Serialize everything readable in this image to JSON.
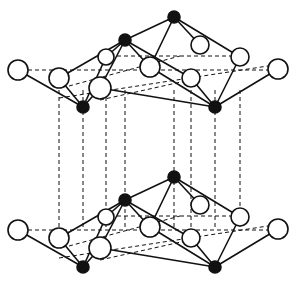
{
  "diagram": {
    "type": "crystal-structure",
    "colors": {
      "background": "#ffffff",
      "stroke": "#111111",
      "black_atom": "#111111",
      "white_atom": "#ffffff"
    },
    "layer_offset_y": 160,
    "atoms": [
      {
        "id": "w1",
        "type": "white",
        "x": 18,
        "y": 70,
        "r": 10
      },
      {
        "id": "w2",
        "type": "white",
        "x": 59,
        "y": 78,
        "r": 10
      },
      {
        "id": "w3",
        "type": "white",
        "x": 106,
        "y": 57,
        "r": 8
      },
      {
        "id": "w4",
        "type": "white",
        "x": 100,
        "y": 88,
        "r": 11
      },
      {
        "id": "w5",
        "type": "white",
        "x": 150,
        "y": 67,
        "r": 10
      },
      {
        "id": "w6",
        "type": "white",
        "x": 200,
        "y": 45,
        "r": 9
      },
      {
        "id": "w7",
        "type": "white",
        "x": 240,
        "y": 57,
        "r": 9
      },
      {
        "id": "w8",
        "type": "white",
        "x": 191,
        "y": 78,
        "r": 9
      },
      {
        "id": "w9",
        "type": "white",
        "x": 278,
        "y": 69,
        "r": 10
      },
      {
        "id": "b1",
        "type": "black",
        "x": 83,
        "y": 107,
        "r": 6
      },
      {
        "id": "b2",
        "type": "black",
        "x": 125,
        "y": 40,
        "r": 6
      },
      {
        "id": "b3",
        "type": "black",
        "x": 174,
        "y": 17,
        "r": 6
      },
      {
        "id": "b4",
        "type": "black",
        "x": 215,
        "y": 107,
        "r": 6
      }
    ],
    "bonds": [
      [
        "w1",
        "b1"
      ],
      [
        "w2",
        "b1"
      ],
      [
        "w4",
        "b1"
      ],
      [
        "w3",
        "b1"
      ],
      [
        "w2",
        "b2"
      ],
      [
        "w3",
        "b2"
      ],
      [
        "w4",
        "b2"
      ],
      [
        "w5",
        "b2"
      ],
      [
        "b2",
        "w8"
      ],
      [
        "b2",
        "b3"
      ],
      [
        "w5",
        "b3"
      ],
      [
        "w6",
        "b3"
      ],
      [
        "w7",
        "b3"
      ],
      [
        "w5",
        "b4"
      ],
      [
        "w7",
        "b4"
      ],
      [
        "w8",
        "b4"
      ],
      [
        "w9",
        "b4"
      ],
      [
        "w4",
        "b4"
      ]
    ],
    "dashed_horizontal": [
      [
        [
          28,
          70
        ],
        [
          268,
          70
        ]
      ],
      [
        [
          69,
          86
        ],
        [
          180,
          56
        ]
      ],
      [
        [
          59,
          98
        ],
        [
          268,
          66
        ]
      ],
      [
        [
          110,
          56
        ],
        [
          240,
          56
        ]
      ],
      [
        [
          100,
          100
        ],
        [
          190,
          80
        ]
      ]
    ],
    "dashed_vertical_x": [
      59,
      83,
      106,
      125,
      174,
      191,
      215,
      240
    ]
  }
}
